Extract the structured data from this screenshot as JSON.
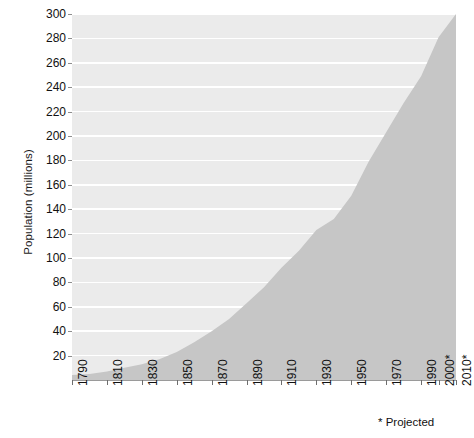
{
  "chart_data": {
    "type": "area",
    "title": "",
    "subtitle": "",
    "xlabel": "",
    "ylabel": "Population (millions)",
    "xlim": [
      1790,
      2010
    ],
    "ylim": [
      0,
      300
    ],
    "grid": true,
    "legend": null,
    "annotations": [
      "* Projected"
    ],
    "y_ticks": [
      20,
      40,
      60,
      80,
      100,
      120,
      140,
      160,
      180,
      200,
      220,
      240,
      260,
      280,
      300
    ],
    "x_tick_labels": [
      "1790",
      "1810",
      "1830",
      "1850",
      "1870",
      "1890",
      "1910",
      "1930",
      "1950",
      "1970",
      "1990",
      "2000*",
      "2010*"
    ],
    "x_tick_years": [
      1790,
      1810,
      1830,
      1850,
      1870,
      1890,
      1910,
      1930,
      1950,
      1970,
      1990,
      2000,
      2010
    ],
    "x": [
      1790,
      1800,
      1810,
      1820,
      1830,
      1840,
      1850,
      1860,
      1870,
      1880,
      1890,
      1900,
      1910,
      1920,
      1930,
      1940,
      1950,
      1960,
      1970,
      1980,
      1990,
      2000,
      2010
    ],
    "values": [
      4,
      5,
      7,
      10,
      13,
      17,
      23,
      31,
      40,
      50,
      63,
      76,
      92,
      106,
      123,
      132,
      151,
      179,
      203,
      227,
      249,
      281,
      300
    ],
    "series": [
      {
        "name": "Population",
        "values": [
          4,
          5,
          7,
          10,
          13,
          17,
          23,
          31,
          40,
          50,
          63,
          76,
          92,
          106,
          123,
          132,
          151,
          179,
          203,
          227,
          249,
          281,
          300
        ]
      }
    ],
    "colors": {
      "area_fill": "#c6c6c6",
      "plot_background": "#ebebeb",
      "gridline": "#ffffff",
      "axis": "#8d8d8d",
      "text": "#111111"
    }
  },
  "footnote": "* Projected"
}
